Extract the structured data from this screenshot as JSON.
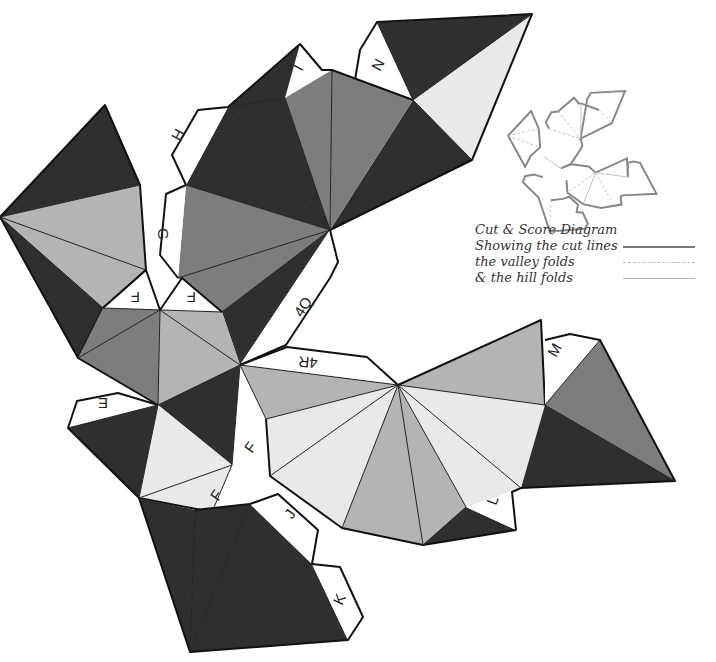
{
  "diagram": {
    "type": "papercraft-net",
    "shades": {
      "dark": "#2f2f2f",
      "medium": "#7d7d7d",
      "light": "#b4b4b4",
      "extra_light": "#e9e9e9",
      "tab": "#ffffff"
    },
    "tab_labels": {
      "N": "N",
      "I": "I",
      "H": "H",
      "G": "G",
      "F1": "F",
      "F2": "F",
      "F3": "F",
      "F4": "F",
      "Q": "4Q",
      "R": "4R",
      "M": "M",
      "E": "E",
      "J": "J",
      "K": "K",
      "L": "L"
    }
  },
  "legend": {
    "title": "Cut & Score Diagram",
    "items": [
      {
        "label": "Showing the cut lines",
        "style": "solid",
        "color": "#777777"
      },
      {
        "label": "the valley folds",
        "style": "dashed",
        "color": "#bbbbbb"
      },
      {
        "label": "& the hill folds",
        "style": "solid-thin",
        "color": "#bbbbbb"
      }
    ]
  }
}
